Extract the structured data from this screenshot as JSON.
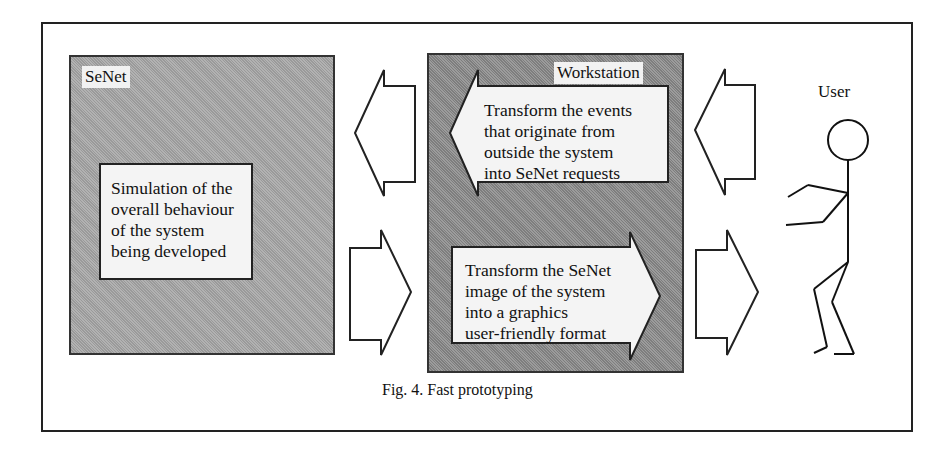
{
  "figure": {
    "caption": "Fig. 4.  Fast prototyping",
    "senet": {
      "label": "SeNet",
      "description_lines": [
        "Simulation of the",
        "overall behaviour",
        "of the system",
        "being developed"
      ]
    },
    "workstation": {
      "label": "Workstation",
      "inbound_arrow_lines": [
        "Transform the events",
        "that originate from",
        "outside the system",
        "into SeNet requests"
      ],
      "outbound_arrow_lines": [
        "Transform the SeNet",
        "image of the system",
        "into a graphics",
        "user-friendly format"
      ]
    },
    "user": {
      "label": "User",
      "icon": "stick-figure-icon"
    },
    "colors": {
      "senet_fill": "#a6a6a6",
      "workstation_fill": "#8c8c8c",
      "text_box_fill": "#f4f4f4",
      "stroke": "#222222"
    }
  }
}
